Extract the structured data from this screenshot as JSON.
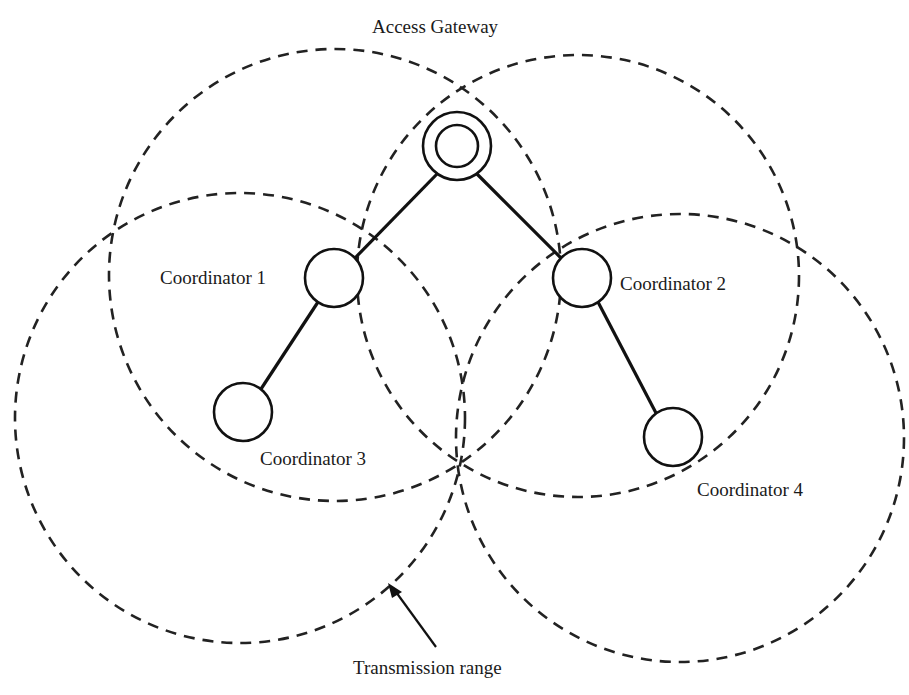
{
  "diagram": {
    "title": "",
    "nodes": [
      {
        "id": "gateway",
        "label": "Access Gateway",
        "type": "gateway"
      },
      {
        "id": "c1",
        "label": "Coordinator 1",
        "type": "coordinator"
      },
      {
        "id": "c2",
        "label": "Coordinator 2",
        "type": "coordinator"
      },
      {
        "id": "c3",
        "label": "Coordinator 3",
        "type": "coordinator"
      },
      {
        "id": "c4",
        "label": "Coordinator 4",
        "type": "coordinator"
      }
    ],
    "edges": [
      {
        "from": "gateway",
        "to": "c1"
      },
      {
        "from": "gateway",
        "to": "c2"
      },
      {
        "from": "c1",
        "to": "c3"
      },
      {
        "from": "c2",
        "to": "c4"
      }
    ],
    "ranges": [
      {
        "owner": "c1"
      },
      {
        "owner": "c2"
      },
      {
        "owner": "c3"
      },
      {
        "owner": "c4"
      }
    ],
    "annotation": {
      "label": "Transmission range",
      "points_to": "c3-range"
    },
    "colors": {
      "stroke": "#111111",
      "background": "#ffffff"
    }
  }
}
